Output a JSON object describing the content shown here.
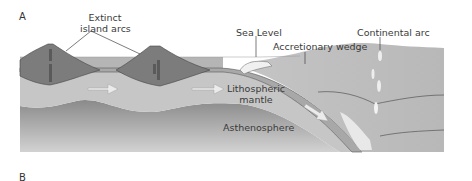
{
  "panels": {
    "a": "A",
    "b": "B"
  },
  "labels": {
    "extinct_island_arcs_line1": "Extinct",
    "extinct_island_arcs_line2": "island arcs",
    "sea_level": "Sea Level",
    "accretionary_wedge": "Accretionary wedge",
    "continental_arc": "Continental arc",
    "lithospheric_mantle_line1": "Lithospheric",
    "lithospheric_mantle_line2": "mantle",
    "asthenosphere": "Asthenosphere"
  },
  "colors": {
    "ocean": "#b3b3b3",
    "crust": "#a6a6a6",
    "lithosphere": "#c4c4c4",
    "asthenosphere_top": "#8c8c8c",
    "asthenosphere_bottom": "#cfcfcf",
    "volcano": "#7a7a7a",
    "continent": "#bdbdbd",
    "arrow": "#e6e6e6"
  }
}
